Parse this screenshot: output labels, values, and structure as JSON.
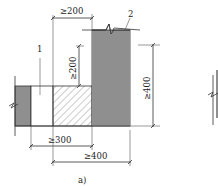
{
  "figure": {
    "caption": "a)",
    "colors": {
      "wall_fill": "#8f8f8f",
      "line": "#333333",
      "hatch": "#666666",
      "background": "#ffffff"
    },
    "callouts": [
      {
        "id": "1",
        "label": "1"
      },
      {
        "id": "2",
        "label": "2"
      }
    ],
    "dimensions": {
      "top_width": "≥200",
      "inner_height": "≥200",
      "right_height": "≥400",
      "bottom_inner": "≥300",
      "bottom_outer": "≥400"
    }
  }
}
